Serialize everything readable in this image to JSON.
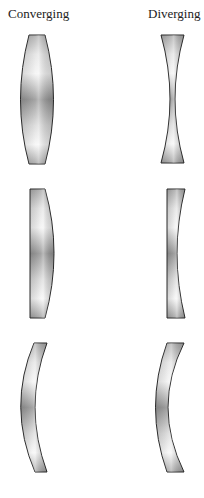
{
  "diagram": {
    "columns": [
      {
        "label": "Converging",
        "lenses": [
          "biconvex",
          "plano-convex",
          "convex meniscus"
        ]
      },
      {
        "label": "Diverging",
        "lenses": [
          "biconcave",
          "plano-concave",
          "concave meniscus"
        ]
      }
    ],
    "colors": {
      "outline": "#2a2a2a",
      "fill_light": "#f2f2f2",
      "fill_mid": "#c8c8c8",
      "fill_dark": "#8f8f8f"
    }
  }
}
